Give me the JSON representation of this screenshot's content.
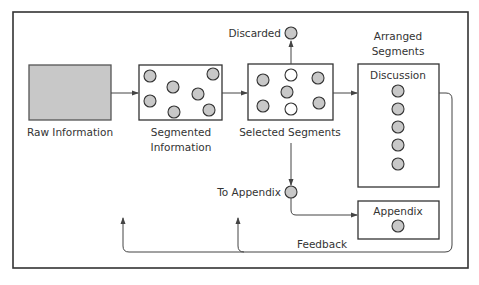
{
  "colors": {
    "segment_fill": "#c8c8c8",
    "removed_fill": "#ffffff",
    "raw_fill": "#c8c8c8",
    "stroke": "#333333"
  },
  "labels": {
    "raw": "Raw Information",
    "segmented_line1": "Segmented",
    "segmented_line2": "Information",
    "selected": "Selected Segments",
    "discarded": "Discarded",
    "arranged_line1": "Arranged",
    "arranged_line2": "Segments",
    "discussion": "Discussion",
    "to_appendix": "To Appendix",
    "appendix": "Appendix",
    "feedback": "Feedback"
  },
  "segmented_box": {
    "segment_count": 7
  },
  "selected_box": {
    "kept_count": 5,
    "removed_count": 2
  },
  "discussion_box": {
    "segment_count": 5
  },
  "appendix_box": {
    "segment_count": 1
  }
}
